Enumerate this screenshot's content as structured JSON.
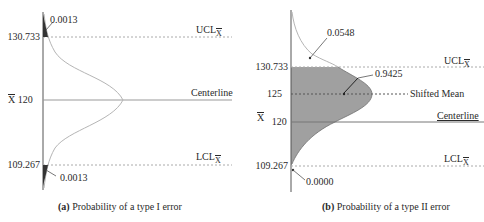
{
  "panel_a": {
    "caption_prefix": "(a)",
    "caption_text": "Probability of a type I error",
    "axis_labels": {
      "ucl_value": "130.733",
      "center_value": "120",
      "center_symbol": "X",
      "lcl_value": "109.267"
    },
    "line_labels": {
      "ucl": "UCL",
      "centerline": "Centerline",
      "lcl": "LCL",
      "subscript": "X"
    },
    "annotations": {
      "upper_tail": "0.0013",
      "lower_tail": "0.0013"
    }
  },
  "panel_b": {
    "caption_prefix": "(b)",
    "caption_text": "Probability of a type II error",
    "axis_labels": {
      "ucl_value": "130.733",
      "shifted_value": "125",
      "center_value": "120",
      "center_symbol": "X",
      "lcl_value": "109.267"
    },
    "line_labels": {
      "ucl": "UCL",
      "shifted_mean": "Shifted Mean",
      "centerline": "Centerline",
      "lcl": "LCL",
      "subscript": "X"
    },
    "annotations": {
      "upper_tail": "0.0548",
      "shaded_area": "0.9425",
      "lower_tail": "0.0000"
    }
  },
  "colors": {
    "shade": "#8f8f8f",
    "line": "#9a9a9a",
    "curve": "#b0b0b0",
    "text": "#2a2a2a"
  }
}
